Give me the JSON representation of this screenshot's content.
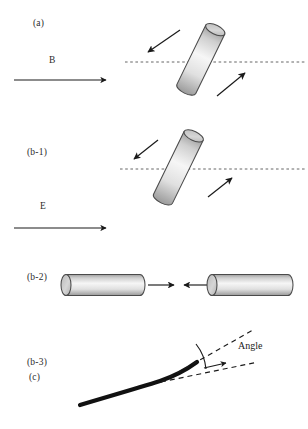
{
  "figure": {
    "type": "scientific-diagram",
    "width": 308,
    "height": 429,
    "background_color": "#ffffff"
  },
  "panels": {
    "a": {
      "label": "(a)",
      "field_label": "B",
      "field_arrow": {
        "direction": "right",
        "x1": 14,
        "y1": 80,
        "x2": 108,
        "y2": 80
      },
      "reference_line": {
        "style": "dashed",
        "x1": 125,
        "y1": 62,
        "x2": 305,
        "y2": 62
      },
      "cylinder": {
        "tilt_deg": 26,
        "top": [
          183,
          27
        ],
        "bottom": [
          216,
          97
        ]
      },
      "torque_arrows": [
        {
          "name": "upper-left-torque-arrow",
          "x1": 180,
          "y1": 30,
          "x2": 147,
          "y2": 53
        },
        {
          "name": "lower-right-torque-arrow",
          "x1": 217,
          "y1": 96,
          "x2": 246,
          "y2": 72
        }
      ]
    },
    "b1": {
      "label": "(b-1)",
      "field_label": "E",
      "field_arrow": {
        "direction": "right",
        "x1": 14,
        "y1": 228,
        "x2": 108,
        "y2": 228
      },
      "reference_line": {
        "style": "dashed",
        "x1": 120,
        "y1": 169,
        "x2": 305,
        "y2": 169
      },
      "cylinder": {
        "tilt_deg": 26,
        "top": [
          158,
          133
        ],
        "bottom": [
          196,
          207
        ]
      },
      "torque_arrows": [
        {
          "name": "upper-left-torque-arrow",
          "x1": 157,
          "y1": 140,
          "x2": 133,
          "y2": 159
        },
        {
          "name": "lower-right-torque-arrow",
          "x1": 208,
          "y1": 197,
          "x2": 233,
          "y2": 178
        }
      ]
    },
    "b2": {
      "label": "(b-2)",
      "left_cylinder": {
        "x1": 66,
        "x2": 148,
        "y": 285,
        "arrow_direction": "right"
      },
      "right_cylinder": {
        "x1": 210,
        "x2": 295,
        "y": 285,
        "arrow_direction": "left"
      },
      "attraction_arrows": [
        {
          "name": "left-attraction-arrow",
          "x1": 150,
          "y1": 285,
          "x2": 174,
          "y2": 285
        },
        {
          "name": "right-attraction-arrow",
          "x1": 207,
          "y1": 285,
          "x2": 184,
          "y2": 285
        }
      ]
    },
    "b3": {
      "label": "(b-3)"
    },
    "c": {
      "label": "(c)",
      "angle_label": "Angle",
      "filament": {
        "color": "#111111",
        "points": [
          [
            80,
            405
          ],
          [
            140,
            387
          ],
          [
            168,
            377
          ],
          [
            186,
            368
          ],
          [
            197,
            362
          ]
        ]
      },
      "dashed_guides": [
        {
          "name": "lower-dashed-guide",
          "x1": 163,
          "y1": 381,
          "x2": 258,
          "y2": 362
        },
        {
          "name": "upper-dashed-guide",
          "x1": 163,
          "y1": 381,
          "x2": 253,
          "y2": 330
        }
      ],
      "angle_arc": {
        "cx": 163,
        "cy": 381,
        "radius": 46
      },
      "angle_arrow": {
        "x1": 205,
        "y1": 368,
        "x2": 225,
        "y2": 363
      }
    }
  },
  "style": {
    "cylinder_fill_light": "#f4f4f4",
    "cylinder_fill_mid": "#d9d9d9",
    "cylinder_fill_dark": "#9e9e9e",
    "cylinder_cap_fill": "#c9c9c9",
    "cylinder_stroke": "#4a4a4a",
    "arrow_color": "#1a1a1a",
    "dashed_color": "#555555",
    "text_color": "#2b2b2b"
  }
}
